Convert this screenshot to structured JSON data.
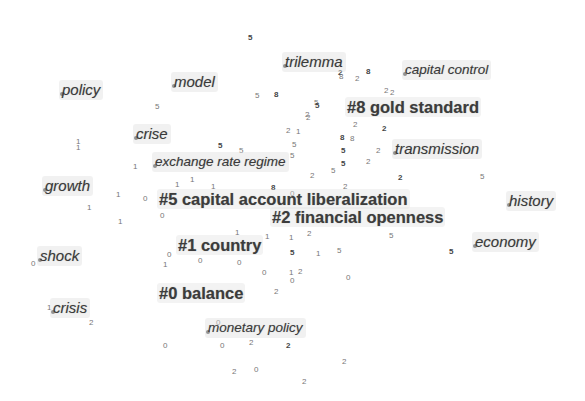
{
  "diagram": {
    "type": "keyword-cluster-network",
    "clusters": [
      {
        "id": 0,
        "label": "#0 balance",
        "x": 157,
        "y": 283
      },
      {
        "id": 1,
        "label": "#1 country",
        "x": 176,
        "y": 235
      },
      {
        "id": 2,
        "label": "#2 financial openness",
        "x": 270,
        "y": 207
      },
      {
        "id": 5,
        "label": "#5 capital account liberalization",
        "x": 157,
        "y": 189
      },
      {
        "id": 8,
        "label": "#8 gold standard",
        "x": 345,
        "y": 97
      }
    ],
    "keywords": [
      {
        "label": "policy",
        "x": 59,
        "y": 80
      },
      {
        "label": "model",
        "x": 171,
        "y": 72
      },
      {
        "label": "trilemma",
        "x": 282,
        "y": 52
      },
      {
        "label": "capital control",
        "x": 402,
        "y": 60
      },
      {
        "label": "crise",
        "x": 133,
        "y": 124
      },
      {
        "label": "exchange rate regime",
        "x": 152,
        "y": 152
      },
      {
        "label": "transmission",
        "x": 392,
        "y": 139
      },
      {
        "label": "growth",
        "x": 42,
        "y": 176
      },
      {
        "label": "history",
        "x": 506,
        "y": 191
      },
      {
        "label": "economy",
        "x": 472,
        "y": 232
      },
      {
        "label": "shock",
        "x": 37,
        "y": 246
      },
      {
        "label": "crisis",
        "x": 50,
        "y": 298
      },
      {
        "label": "monetary policy",
        "x": 205,
        "y": 318
      }
    ],
    "node_numbers": [
      {
        "t": "5",
        "x": 248,
        "y": 33
      },
      {
        "t": "5",
        "x": 155,
        "y": 102
      },
      {
        "t": "5",
        "x": 255,
        "y": 91
      },
      {
        "t": "8",
        "x": 274,
        "y": 90
      },
      {
        "t": "5",
        "x": 314,
        "y": 98
      },
      {
        "t": "2",
        "x": 305,
        "y": 110
      },
      {
        "t": "2",
        "x": 338,
        "y": 68
      },
      {
        "t": "8",
        "x": 339,
        "y": 72
      },
      {
        "t": "2",
        "x": 355,
        "y": 74
      },
      {
        "t": "8",
        "x": 366,
        "y": 67
      },
      {
        "t": "2",
        "x": 384,
        "y": 86
      },
      {
        "t": "2",
        "x": 390,
        "y": 88
      },
      {
        "t": "5",
        "x": 315,
        "y": 101
      },
      {
        "t": "2",
        "x": 306,
        "y": 113
      },
      {
        "t": "2",
        "x": 353,
        "y": 120
      },
      {
        "t": "2",
        "x": 382,
        "y": 124
      },
      {
        "t": "2",
        "x": 286,
        "y": 126
      },
      {
        "t": "1",
        "x": 296,
        "y": 127
      },
      {
        "t": "8",
        "x": 340,
        "y": 133
      },
      {
        "t": "8",
        "x": 350,
        "y": 134
      },
      {
        "t": "5",
        "x": 292,
        "y": 140
      },
      {
        "t": "5",
        "x": 341,
        "y": 146
      },
      {
        "t": "2",
        "x": 376,
        "y": 146
      },
      {
        "t": "2",
        "x": 366,
        "y": 157
      },
      {
        "t": "5",
        "x": 341,
        "y": 159
      },
      {
        "t": "5",
        "x": 331,
        "y": 166
      },
      {
        "t": "2",
        "x": 310,
        "y": 171
      },
      {
        "t": "2",
        "x": 398,
        "y": 173
      },
      {
        "t": "2",
        "x": 343,
        "y": 182
      },
      {
        "t": "5",
        "x": 480,
        "y": 172
      },
      {
        "t": "5",
        "x": 218,
        "y": 141
      },
      {
        "t": "5",
        "x": 239,
        "y": 146
      },
      {
        "t": "5",
        "x": 290,
        "y": 151
      },
      {
        "t": "1",
        "x": 76,
        "y": 137
      },
      {
        "t": "1",
        "x": 76,
        "y": 143
      },
      {
        "t": "1",
        "x": 133,
        "y": 162
      },
      {
        "t": "1",
        "x": 175,
        "y": 180
      },
      {
        "t": "1",
        "x": 190,
        "y": 175
      },
      {
        "t": "1",
        "x": 211,
        "y": 182
      },
      {
        "t": "8",
        "x": 271,
        "y": 183
      },
      {
        "t": "1",
        "x": 116,
        "y": 190
      },
      {
        "t": "1",
        "x": 87,
        "y": 203
      },
      {
        "t": "1",
        "x": 118,
        "y": 217
      },
      {
        "t": "0",
        "x": 143,
        "y": 194
      },
      {
        "t": "0",
        "x": 160,
        "y": 211
      },
      {
        "t": "0",
        "x": 290,
        "y": 189
      },
      {
        "t": "1",
        "x": 235,
        "y": 228
      },
      {
        "t": "1",
        "x": 265,
        "y": 232
      },
      {
        "t": "1",
        "x": 289,
        "y": 233
      },
      {
        "t": "2",
        "x": 307,
        "y": 229
      },
      {
        "t": "5",
        "x": 389,
        "y": 231
      },
      {
        "t": "5",
        "x": 290,
        "y": 248
      },
      {
        "t": "1",
        "x": 316,
        "y": 249
      },
      {
        "t": "5",
        "x": 337,
        "y": 246
      },
      {
        "t": "5",
        "x": 449,
        "y": 247
      },
      {
        "t": "0",
        "x": 167,
        "y": 250
      },
      {
        "t": "1",
        "x": 163,
        "y": 260
      },
      {
        "t": "0",
        "x": 198,
        "y": 256
      },
      {
        "t": "0",
        "x": 237,
        "y": 258
      },
      {
        "t": "0",
        "x": 262,
        "y": 268
      },
      {
        "t": "1",
        "x": 289,
        "y": 268
      },
      {
        "t": "2",
        "x": 298,
        "y": 267
      },
      {
        "t": "0",
        "x": 290,
        "y": 276
      },
      {
        "t": "0",
        "x": 346,
        "y": 273
      },
      {
        "t": "2",
        "x": 274,
        "y": 287
      },
      {
        "t": "0",
        "x": 216,
        "y": 318
      },
      {
        "t": "0",
        "x": 163,
        "y": 341
      },
      {
        "t": "0",
        "x": 220,
        "y": 341
      },
      {
        "t": "2",
        "x": 249,
        "y": 338
      },
      {
        "t": "2",
        "x": 286,
        "y": 341
      },
      {
        "t": "2",
        "x": 342,
        "y": 357
      },
      {
        "t": "2",
        "x": 232,
        "y": 367
      },
      {
        "t": "0",
        "x": 254,
        "y": 365
      },
      {
        "t": "2",
        "x": 302,
        "y": 377
      },
      {
        "t": "2",
        "x": 89,
        "y": 318
      },
      {
        "t": "1",
        "x": 47,
        "y": 303
      },
      {
        "t": "0",
        "x": 31,
        "y": 259
      }
    ]
  }
}
